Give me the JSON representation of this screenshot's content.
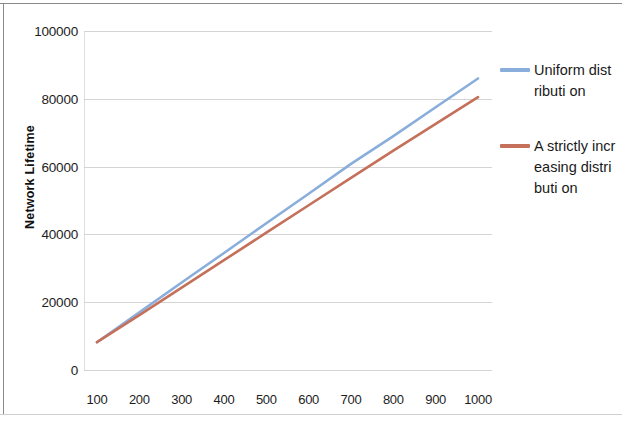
{
  "chart_data": {
    "type": "line",
    "title": "",
    "xlabel": "",
    "ylabel": "Network Lifetime",
    "x": [
      100,
      200,
      300,
      400,
      500,
      600,
      700,
      800,
      900,
      1000
    ],
    "xticklabels": [
      "100",
      "200",
      "300",
      "400",
      "500",
      "600",
      "700",
      "800",
      "900",
      "1000"
    ],
    "yticklabels": [
      "0",
      "20000",
      "40000",
      "60000",
      "80000",
      "100000"
    ],
    "yticks": [
      0,
      20000,
      40000,
      60000,
      80000,
      100000
    ],
    "ylim": [
      0,
      100000
    ],
    "xlim": [
      100,
      1000
    ],
    "grid": true,
    "legend_position": "right",
    "series": [
      {
        "name": "Uniform distributi on",
        "color": "#8AAEDB",
        "values": [
          8200,
          17000,
          25800,
          34500,
          43300,
          52000,
          60800,
          69000,
          77500,
          86000
        ]
      },
      {
        "name": "A strictly increasing distributi on",
        "color": "#C5705A",
        "values": [
          8200,
          16200,
          24300,
          32400,
          40500,
          48600,
          56700,
          64700,
          72600,
          80500
        ]
      }
    ]
  },
  "legend": {
    "entries": [
      {
        "label": "Uniform distributi on",
        "color": "#8AAEDB",
        "icon": "line-swatch-blue"
      },
      {
        "label": "A strictly increasing distributi on",
        "color": "#C5705A",
        "icon": "line-swatch-red"
      }
    ]
  }
}
